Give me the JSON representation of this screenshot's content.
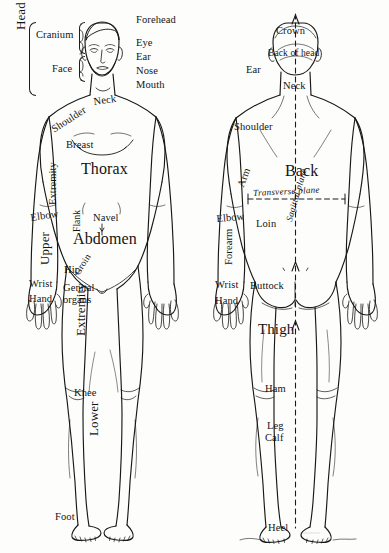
{
  "plate": {
    "title": "Regions of the Human Body — Anterior and Posterior Views",
    "background_color": "#fdfdfb",
    "ink_color": "#141414",
    "width": 389,
    "height": 553,
    "signature": "~~~~~~~"
  },
  "front_figure": {
    "view_name": "anterior",
    "group_brackets": [
      {
        "label": "Head"
      }
    ],
    "labels": [
      {
        "id": "head",
        "text": "Head",
        "x": 14,
        "y": 30,
        "size": "sz-l",
        "rot": -90
      },
      {
        "id": "cranium",
        "text": "Cranium",
        "x": 36,
        "y": 30,
        "size": "sz-m",
        "rot": 0
      },
      {
        "id": "face",
        "text": "Face",
        "x": 52,
        "y": 64,
        "size": "sz-m",
        "rot": 0
      },
      {
        "id": "forehead",
        "text": "Forehead",
        "x": 136,
        "y": 15,
        "size": "sz-m",
        "rot": 0
      },
      {
        "id": "eye",
        "text": "Eye",
        "x": 136,
        "y": 38,
        "size": "sz-m",
        "rot": 0
      },
      {
        "id": "ear",
        "text": "Ear",
        "x": 136,
        "y": 52,
        "size": "sz-m",
        "rot": 0
      },
      {
        "id": "nose",
        "text": "Nose",
        "x": 136,
        "y": 66,
        "size": "sz-m",
        "rot": 0
      },
      {
        "id": "mouth",
        "text": "Mouth",
        "x": 136,
        "y": 80,
        "size": "sz-m",
        "rot": 0
      },
      {
        "id": "neck",
        "text": "Neck",
        "x": 93,
        "y": 97,
        "size": "sz-m",
        "rot": -8
      },
      {
        "id": "shoulder",
        "text": "Shoulder",
        "x": 50,
        "y": 126,
        "size": "sz-m",
        "rot": -33
      },
      {
        "id": "breast",
        "text": "Breast",
        "x": 66,
        "y": 140,
        "size": "sz-m",
        "rot": 0
      },
      {
        "id": "thorax",
        "text": "Thorax",
        "x": 81,
        "y": 161,
        "size": "sz-big",
        "rot": 0
      },
      {
        "id": "extremity-up",
        "text": "Extremity",
        "x": 48,
        "y": 205,
        "size": "sz-m",
        "rot": -90
      },
      {
        "id": "flank",
        "text": "Flank",
        "x": 73,
        "y": 232,
        "size": "sz-s",
        "rot": -90
      },
      {
        "id": "elbow",
        "text": "Elbow",
        "x": 30,
        "y": 213,
        "size": "sz-m",
        "rot": -8
      },
      {
        "id": "navel",
        "text": "Navel",
        "x": 93,
        "y": 213,
        "size": "sz-m",
        "rot": 0
      },
      {
        "id": "abdomen",
        "text": "Abdomen",
        "x": 73,
        "y": 231,
        "size": "sz-big",
        "rot": 0
      },
      {
        "id": "upper",
        "text": "Upper",
        "x": 38,
        "y": 265,
        "size": "sz-l",
        "rot": -90
      },
      {
        "id": "groin",
        "text": "Groin",
        "x": 73,
        "y": 272,
        "size": "sz-s",
        "rot": -58
      },
      {
        "id": "hip",
        "text": "Hip",
        "x": 64,
        "y": 265,
        "size": "sz-m",
        "rot": 0
      },
      {
        "id": "wrist",
        "text": "Wrist",
        "x": 29,
        "y": 279,
        "size": "sz-m",
        "rot": 0
      },
      {
        "id": "genital-1",
        "text": "Genital",
        "x": 63,
        "y": 283,
        "size": "sz-m",
        "rot": 0
      },
      {
        "id": "genital-2",
        "text": "organs",
        "x": 63,
        "y": 295,
        "size": "sz-m",
        "rot": 0
      },
      {
        "id": "hand",
        "text": "Hand",
        "x": 29,
        "y": 294,
        "size": "sz-m",
        "rot": 0
      },
      {
        "id": "extremity-low",
        "text": "Extremity",
        "x": 74,
        "y": 336,
        "size": "sz-l",
        "rot": -90
      },
      {
        "id": "knee",
        "text": "Knee",
        "x": 74,
        "y": 388,
        "size": "sz-m",
        "rot": 0
      },
      {
        "id": "lower",
        "text": "Lower",
        "x": 87,
        "y": 436,
        "size": "sz-l",
        "rot": -90
      },
      {
        "id": "foot",
        "text": "Foot",
        "x": 55,
        "y": 512,
        "size": "sz-m",
        "rot": 0
      }
    ]
  },
  "back_figure": {
    "view_name": "posterior",
    "labels": [
      {
        "id": "crown",
        "text": "Crown",
        "x": 276,
        "y": 26,
        "size": "sz-m",
        "rot": 0
      },
      {
        "id": "back-of-head",
        "text": "Back of head",
        "x": 268,
        "y": 49,
        "size": "sz-s",
        "rot": 0
      },
      {
        "id": "ear-back",
        "text": "Ear",
        "x": 246,
        "y": 65,
        "size": "sz-m",
        "rot": 0
      },
      {
        "id": "neck-back",
        "text": "Neck",
        "x": 283,
        "y": 81,
        "size": "sz-m",
        "rot": 0
      },
      {
        "id": "shoulder-back",
        "text": "Shoulder",
        "x": 234,
        "y": 122,
        "size": "sz-m",
        "rot": 0
      },
      {
        "id": "back",
        "text": "Back",
        "x": 285,
        "y": 163,
        "size": "sz-big",
        "rot": 0
      },
      {
        "id": "arm",
        "text": "Arm",
        "x": 236,
        "y": 185,
        "size": "sz-m",
        "rot": -70
      },
      {
        "id": "transverse",
        "text": "Transverse plane",
        "x": 253,
        "y": 189,
        "size": "ital",
        "rot": -3
      },
      {
        "id": "elbow-back",
        "text": "Elbow",
        "x": 216,
        "y": 214,
        "size": "sz-m",
        "rot": -5
      },
      {
        "id": "loin",
        "text": "Loin",
        "x": 256,
        "y": 219,
        "size": "sz-m",
        "rot": 0
      },
      {
        "id": "sagittal",
        "text": "Sagittal plane",
        "x": 285,
        "y": 220,
        "size": "ital",
        "rot": -74
      },
      {
        "id": "forearm",
        "text": "Forearm",
        "x": 224,
        "y": 265,
        "size": "sz-m",
        "rot": -90
      },
      {
        "id": "wrist-back",
        "text": "Wrist",
        "x": 215,
        "y": 280,
        "size": "sz-m",
        "rot": 0
      },
      {
        "id": "buttock",
        "text": "Buttock",
        "x": 250,
        "y": 281,
        "size": "sz-m",
        "rot": 0
      },
      {
        "id": "hand-back",
        "text": "Hand",
        "x": 215,
        "y": 296,
        "size": "sz-m",
        "rot": 0
      },
      {
        "id": "thigh",
        "text": "Thigh",
        "x": 258,
        "y": 322,
        "size": "sz-xl",
        "rot": 0
      },
      {
        "id": "ham",
        "text": "Ham",
        "x": 265,
        "y": 384,
        "size": "sz-m",
        "rot": 0
      },
      {
        "id": "leg",
        "text": "Leg",
        "x": 267,
        "y": 421,
        "size": "sz-m",
        "rot": 0
      },
      {
        "id": "calf",
        "text": "Calf",
        "x": 265,
        "y": 433,
        "size": "sz-m",
        "rot": 0
      },
      {
        "id": "heel",
        "text": "Heel",
        "x": 268,
        "y": 523,
        "size": "sz-m",
        "rot": 0
      }
    ],
    "planes": [
      {
        "name": "Transverse plane",
        "orientation": "horizontal"
      },
      {
        "name": "Sagittal plane",
        "orientation": "vertical"
      }
    ]
  }
}
